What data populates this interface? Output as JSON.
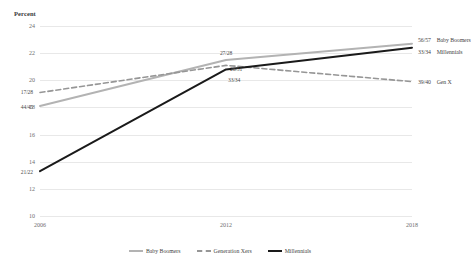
{
  "chart_data": {
    "type": "line",
    "title": "",
    "subtitle": "",
    "xlabel": "",
    "ylabel": "Percent",
    "x": [
      "2006",
      "2012",
      "2018"
    ],
    "categories": [
      "2006",
      "2012",
      "2018"
    ],
    "xlim": [
      "2006",
      "2018"
    ],
    "ylim": [
      10,
      24
    ],
    "yticks": [
      "24",
      "22",
      "20",
      "18",
      "16",
      "14",
      "12",
      "10"
    ],
    "ytick_values": [
      24,
      22,
      20,
      18,
      16,
      14,
      12,
      10
    ],
    "grid": true,
    "legend_position": "bottom",
    "series": [
      {
        "name": "Baby Boomers",
        "values": [
          18.1,
          21.5,
          22.7
        ],
        "point_labels": [
          "44/45",
          "27/28",
          "56/57"
        ],
        "color": "#b3b3b3",
        "style": "solid"
      },
      {
        "name": "Generation Xers",
        "values": [
          19.1,
          21.1,
          19.9
        ],
        "point_labels": [
          "17/28",
          "26/51",
          "39/40"
        ],
        "color": "#969696",
        "style": "dashed"
      },
      {
        "name": "Millennials",
        "values": [
          13.3,
          20.8,
          22.4
        ],
        "point_labels": [
          "21/22",
          "33/34",
          "33/34"
        ],
        "color": "#1a1a1a",
        "style": "solid"
      }
    ],
    "end_labels": [
      {
        "value": "56/57",
        "name": "Baby Boomers"
      },
      {
        "value": "33/34",
        "name": "Millennials"
      },
      {
        "value": "39/40",
        "name": "Gen X"
      }
    ]
  },
  "legend": {
    "items": [
      {
        "label": "Baby Boomers",
        "color": "#b3b3b3"
      },
      {
        "label": "Generation Xers",
        "color": "#969696"
      },
      {
        "label": "Millennials",
        "color": "#1a1a1a"
      }
    ]
  }
}
